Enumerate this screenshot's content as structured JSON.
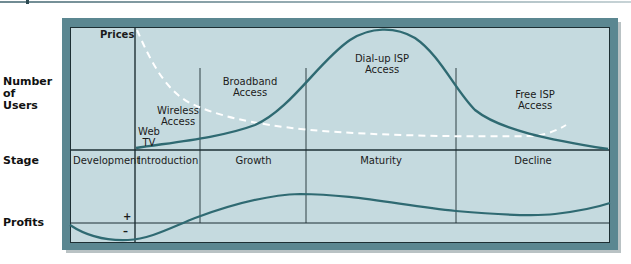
{
  "row_labels": {
    "users": "Number\nof\nUsers",
    "users_lines": [
      "Number",
      "of",
      "Users"
    ],
    "stage": "Stage",
    "profits": "Profits"
  },
  "axis_labels": {
    "prices": "Prices",
    "plus": "+",
    "minus": "–"
  },
  "stages": [
    {
      "label": "Development"
    },
    {
      "label": "Introduction"
    },
    {
      "label": "Growth"
    },
    {
      "label": "Maturity"
    },
    {
      "label": "Decline"
    }
  ],
  "technologies": [
    {
      "lines": [
        "Web",
        "TV"
      ]
    },
    {
      "lines": [
        "Wireless",
        "Access"
      ]
    },
    {
      "lines": [
        "Broadband",
        "Access"
      ]
    },
    {
      "lines": [
        "Dial-up ISP",
        "Access"
      ]
    },
    {
      "lines": [
        "Free ISP",
        "Access"
      ]
    }
  ],
  "curves": {
    "users": {
      "name": "Number of Users",
      "style": "solid",
      "color": "#2f6a72"
    },
    "prices": {
      "name": "Prices",
      "style": "dashed",
      "color": "#ffffff"
    },
    "profits": {
      "name": "Profits",
      "style": "solid",
      "color": "#2f6a72"
    }
  },
  "colors": {
    "panel": "#c5dadf",
    "frame": "#5b8791",
    "curve": "#2f6a72",
    "grid": "#1d2f34"
  }
}
